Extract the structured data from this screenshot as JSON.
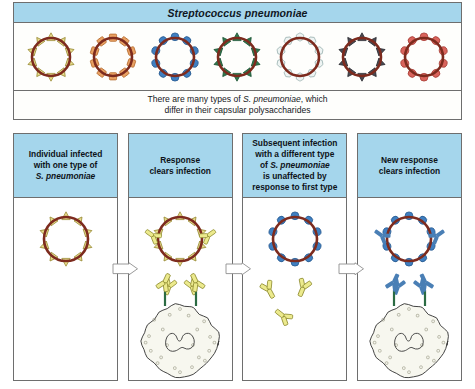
{
  "top": {
    "species_title": "Streptococcus pneumoniae",
    "caption_line1_pre": "There are many types of ",
    "caption_line1_italic": "S. pneumoniae",
    "caption_line1_post": ", which",
    "caption_line2": "differ in their capsular polysaccharides",
    "bacteria": [
      {
        "name": "bacterium-serotype-yellow-triangle",
        "capsule_color": "#e8dd8c",
        "capsule_stroke": "#9a8c38",
        "shape": "triangle",
        "count": 10
      },
      {
        "name": "bacterium-serotype-orange-square",
        "capsule_color": "#e9a163",
        "capsule_stroke": "#b56b2d",
        "shape": "square",
        "count": 10
      },
      {
        "name": "bacterium-serotype-blue-circle",
        "capsule_color": "#3f7fc1",
        "capsule_stroke": "#2a5c91",
        "shape": "circle",
        "count": 10
      },
      {
        "name": "bacterium-serotype-green-triangle",
        "capsule_color": "#2f7a4e",
        "capsule_stroke": "#1d5435",
        "shape": "triangle",
        "count": 10
      },
      {
        "name": "bacterium-serotype-white-hexagon",
        "capsule_color": "#eef4f3",
        "capsule_stroke": "#9fb5b4",
        "shape": "hexagon",
        "count": 10
      },
      {
        "name": "bacterium-serotype-dark-triangle",
        "capsule_color": "#4a4a52",
        "capsule_stroke": "#2b2b31",
        "shape": "triangle",
        "count": 10
      },
      {
        "name": "bacterium-serotype-red-circle",
        "capsule_color": "#d9645c",
        "capsule_stroke": "#a83f38",
        "shape": "circle",
        "count": 10
      }
    ]
  },
  "panels": [
    {
      "id": "panel-1",
      "name": "panel-individual-infected",
      "head_lines": [
        "Individual infected",
        "with one type of"
      ],
      "head_italic_line": "S. pneumoniae",
      "bacterium": {
        "capsule_color": "#e8dd8c",
        "capsule_stroke": "#9a8c38",
        "shape": "triangle"
      },
      "has_antibodies": false,
      "has_free_antibodies": false,
      "has_macrophage": false,
      "antibody_color": ""
    },
    {
      "id": "panel-2",
      "name": "panel-response-clears-infection",
      "head_lines": [
        "Response",
        "clears infection"
      ],
      "head_italic_line": "",
      "bacterium": {
        "capsule_color": "#e8dd8c",
        "capsule_stroke": "#9a8c38",
        "shape": "triangle"
      },
      "has_antibodies": true,
      "has_free_antibodies": false,
      "has_macrophage": true,
      "antibody_color": "#ecea8d",
      "antibody_stroke": "#8d8a2e"
    },
    {
      "id": "panel-3",
      "name": "panel-subsequent-infection-unaffected",
      "head_lines": [
        "Subsequent infection",
        "with a different type",
        "of",
        "is unaffected by",
        "response to first type"
      ],
      "head_italic_line": "S. pneumoniae",
      "bacterium": {
        "capsule_color": "#3f7fc1",
        "capsule_stroke": "#2a5c91",
        "shape": "circle"
      },
      "has_antibodies": false,
      "has_free_antibodies": true,
      "has_macrophage": false,
      "antibody_color": "#ecea8d",
      "antibody_stroke": "#8d8a2e"
    },
    {
      "id": "panel-4",
      "name": "panel-new-response-clears-infection",
      "head_lines": [
        "New response",
        "clears infection"
      ],
      "head_italic_line": "",
      "bacterium": {
        "capsule_color": "#3f7fc1",
        "capsule_stroke": "#2a5c91",
        "shape": "circle"
      },
      "has_antibodies": true,
      "has_free_antibodies": false,
      "has_macrophage": true,
      "antibody_color": "#4a7fb5",
      "antibody_stroke": "#2d5party"
    }
  ],
  "colors": {
    "header_blue": "#a5d6ec",
    "bacterium_ring": "#7d2b1e",
    "border_gray": "#6e6e6e",
    "macrophage_fill": "#f7f7ef",
    "macrophage_stroke": "#3a3a3a",
    "receptor_green": "#2b6b43",
    "page_background": "#ffffff"
  },
  "arrows": [
    {
      "name": "arrow-panel1-to-panel2"
    },
    {
      "name": "arrow-panel2-to-panel3"
    },
    {
      "name": "arrow-panel3-to-panel4"
    }
  ]
}
